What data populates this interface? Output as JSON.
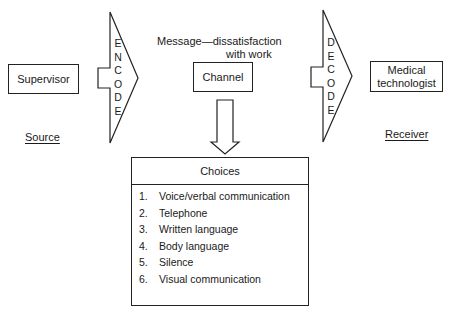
{
  "diagram": {
    "source": {
      "box_label": "Supervisor",
      "caption": "Source"
    },
    "encode": {
      "letters": [
        "E",
        "N",
        "C",
        "O",
        "D",
        "E"
      ]
    },
    "message": {
      "line1": "Message—dissatisfaction",
      "line2": "with work"
    },
    "channel": {
      "box_label": "Channel"
    },
    "decode": {
      "letters": [
        "D",
        "E",
        "C",
        "O",
        "D",
        "E"
      ]
    },
    "receiver": {
      "box_label_line1": "Medical",
      "box_label_line2": "technologist",
      "caption": "Receiver"
    },
    "choices": {
      "title": "Choices",
      "items": [
        {
          "num": "1.",
          "label": "Voice/verbal communication"
        },
        {
          "num": "2.",
          "label": "Telephone"
        },
        {
          "num": "3.",
          "label": "Written language"
        },
        {
          "num": "4.",
          "label": "Body language"
        },
        {
          "num": "5.",
          "label": "Silence"
        },
        {
          "num": "6.",
          "label": "Visual communication"
        }
      ]
    },
    "colors": {
      "stroke": "#222222",
      "background": "#ffffff",
      "text": "#1a1a1a"
    }
  }
}
